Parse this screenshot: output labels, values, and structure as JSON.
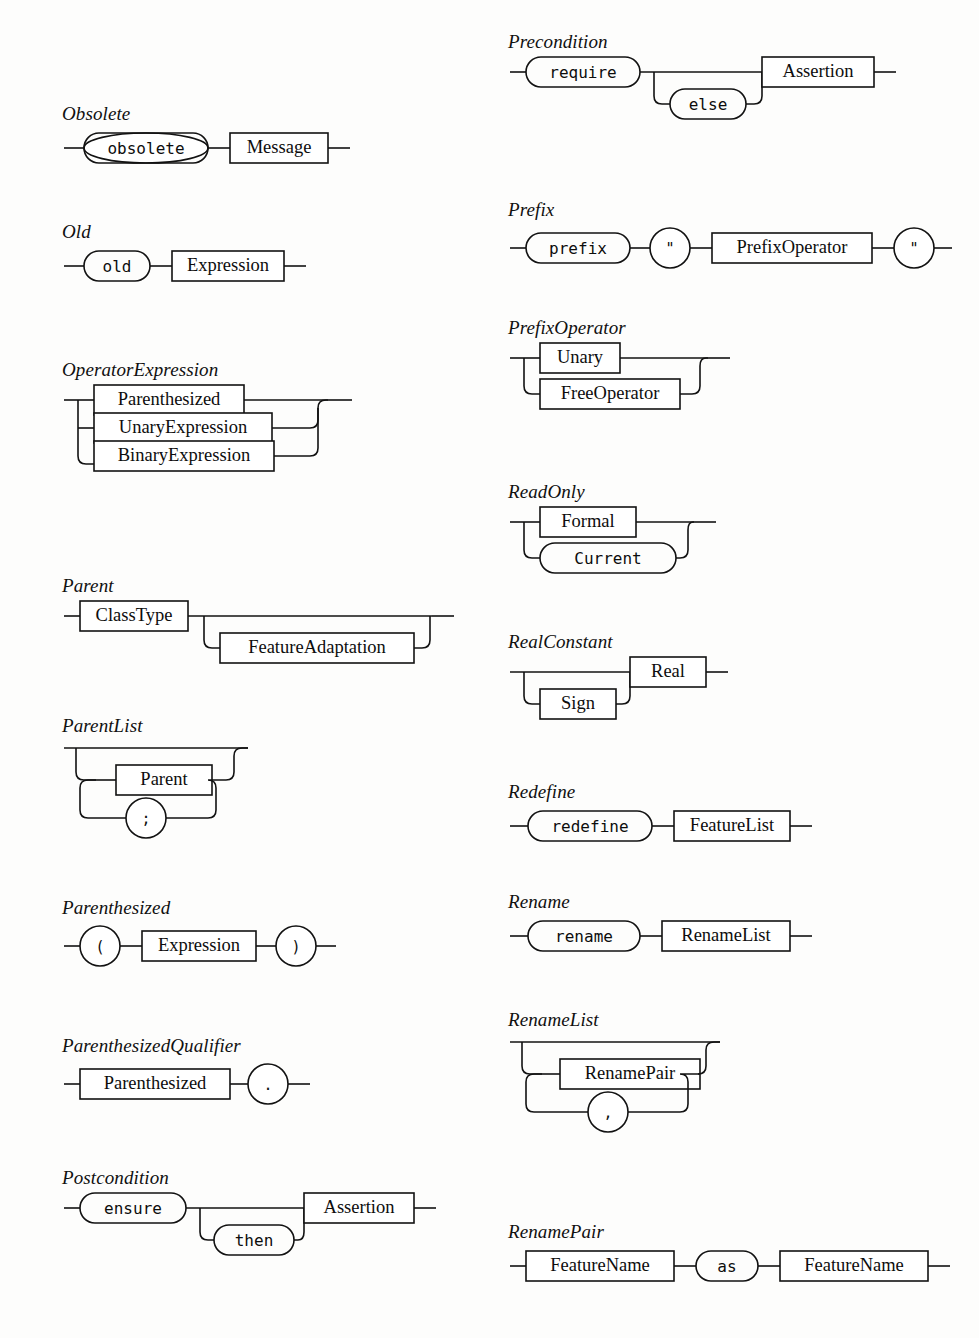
{
  "meta": {
    "kind": "railroad-syntax-diagrams",
    "language": "Eiffel",
    "stroke_color": "#121212",
    "background_color": "#fdfdfc"
  },
  "left_column": {
    "rules": [
      {
        "name": "Obsolete",
        "terminals": [
          "obsolete"
        ],
        "nonterminals": [
          "Message"
        ]
      },
      {
        "name": "Old",
        "terminals": [
          "old"
        ],
        "nonterminals": [
          "Expression"
        ]
      },
      {
        "name": "OperatorExpression",
        "choices": [
          "Parenthesized",
          "UnaryExpression",
          "BinaryExpression"
        ]
      },
      {
        "name": "Parent",
        "nonterminals": [
          "ClassType",
          "FeatureAdaptation"
        ],
        "optional": "FeatureAdaptation"
      },
      {
        "name": "ParentList",
        "repeat_item": "Parent",
        "separator": ";"
      },
      {
        "name": "Parenthesized",
        "terminals": [
          "(",
          ")"
        ],
        "nonterminals": [
          "Expression"
        ]
      },
      {
        "name": "ParenthesizedQualifier",
        "nonterminals": [
          "Parenthesized"
        ],
        "terminals": [
          "."
        ]
      },
      {
        "name": "Postcondition",
        "terminals": [
          "ensure",
          "then"
        ],
        "nonterminals": [
          "Assertion"
        ],
        "optional": "then"
      }
    ]
  },
  "right_column": {
    "rules": [
      {
        "name": "Precondition",
        "terminals": [
          "require",
          "else"
        ],
        "nonterminals": [
          "Assertion"
        ],
        "optional": "else"
      },
      {
        "name": "Prefix",
        "terminals": [
          "prefix",
          "\"",
          "\""
        ],
        "nonterminals": [
          "PrefixOperator"
        ]
      },
      {
        "name": "PrefixOperator",
        "choices": [
          "Unary",
          "FreeOperator"
        ]
      },
      {
        "name": "ReadOnly",
        "choices": [
          "Formal",
          "Current"
        ],
        "choice_kinds": [
          "nonterminal",
          "terminal"
        ]
      },
      {
        "name": "RealConstant",
        "nonterminals": [
          "Sign",
          "Real"
        ],
        "optional": "Sign"
      },
      {
        "name": "Redefine",
        "terminals": [
          "redefine"
        ],
        "nonterminals": [
          "FeatureList"
        ]
      },
      {
        "name": "Rename",
        "terminals": [
          "rename"
        ],
        "nonterminals": [
          "RenameList"
        ]
      },
      {
        "name": "RenameList",
        "repeat_item": "RenamePair",
        "separator": ","
      },
      {
        "name": "RenamePair",
        "nonterminals": [
          "FeatureName",
          "FeatureName"
        ],
        "terminals": [
          "as"
        ]
      }
    ]
  },
  "labels": {
    "obsolete": "Obsolete",
    "obsolete_kw": "obsolete",
    "message": "Message",
    "old": "Old",
    "old_kw": "old",
    "expression": "Expression",
    "operator_expression": "OperatorExpression",
    "parenthesized": "Parenthesized",
    "unary_expression": "UnaryExpression",
    "binary_expression": "BinaryExpression",
    "parent": "Parent",
    "class_type": "ClassType",
    "feature_adaptation": "FeatureAdaptation",
    "parent_list": "ParentList",
    "semicolon": ";",
    "lparen": "(",
    "rparen": ")",
    "parenthesized_qualifier": "ParenthesizedQualifier",
    "dot": ".",
    "postcondition": "Postcondition",
    "ensure_kw": "ensure",
    "then_kw": "then",
    "assertion": "Assertion",
    "precondition": "Precondition",
    "require_kw": "require",
    "else_kw": "else",
    "prefix": "Prefix",
    "prefix_kw": "prefix",
    "quote": "\"",
    "prefix_operator": "PrefixOperator",
    "unary": "Unary",
    "free_operator": "FreeOperator",
    "read_only": "ReadOnly",
    "formal": "Formal",
    "current_kw": "Current",
    "real_constant": "RealConstant",
    "sign": "Sign",
    "real": "Real",
    "redefine": "Redefine",
    "redefine_kw": "redefine",
    "feature_list": "FeatureList",
    "rename": "Rename",
    "rename_kw": "rename",
    "rename_list": "RenameList",
    "rename_pair": "RenamePair",
    "comma": ",",
    "rename_pair_title": "RenamePair",
    "feature_name": "FeatureName",
    "as_kw": "as"
  }
}
